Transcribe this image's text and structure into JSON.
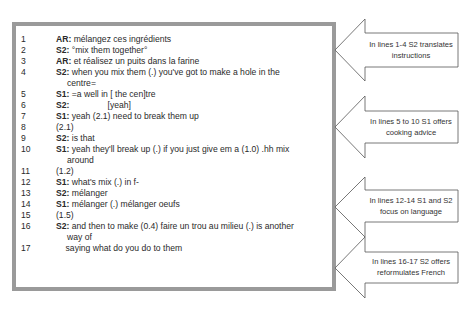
{
  "transcript": {
    "lines": [
      {
        "n": "1",
        "speaker": "AR:",
        "text": " mélangez ces ingrédients",
        "y": 8
      },
      {
        "n": "2",
        "speaker": "S2:",
        "text": " °mix them together°",
        "y": 19
      },
      {
        "n": "3",
        "speaker": "AR:",
        "text": " et réalisez un puits dans la farine",
        "y": 30
      },
      {
        "n": "4",
        "speaker": "S2:",
        "text": " when you mix them (.) you've got to make a hole in the",
        "y": 41,
        "cont": "centre="
      },
      {
        "n": "5",
        "speaker": "S1:",
        "text": " =a well in [ the cen]tre",
        "y": 63
      },
      {
        "n": "6",
        "speaker": "S2:",
        "text": "                [yeah]",
        "y": 74
      },
      {
        "n": "7",
        "speaker": "S1:",
        "text": " yeah (2.1) need to break them up",
        "y": 85
      },
      {
        "n": "8",
        "speaker": "",
        "text": "(2.1)",
        "y": 96
      },
      {
        "n": "9",
        "speaker": "S2:",
        "text": " is that",
        "y": 107
      },
      {
        "n": "10",
        "speaker": "S1:",
        "text": " yeah they'll break up (.) if you just give em a (1.0) .hh mix",
        "y": 118,
        "cont": "around"
      },
      {
        "n": "11",
        "speaker": "",
        "text": "(1.2)",
        "y": 140
      },
      {
        "n": "12",
        "speaker": "S1:",
        "text": " what's mix (.) in f-",
        "y": 151
      },
      {
        "n": "13",
        "speaker": "S2:",
        "text": " mélanger",
        "y": 162
      },
      {
        "n": "14",
        "speaker": "S1:",
        "text": " mélanger (.) mélanger oeufs",
        "y": 173
      },
      {
        "n": "15",
        "speaker": "",
        "text": "(1.5)",
        "y": 184
      },
      {
        "n": "16",
        "speaker": "S2:",
        "text": " and then to make (0.4) faire un trou au milieu (.) is another",
        "y": 195,
        "cont": "way of"
      },
      {
        "n": "17",
        "speaker": "",
        "text": "    saying what do you do to them",
        "y": 217
      }
    ]
  },
  "annotations": [
    {
      "label_line1": "In lines 1-4 S2 translates",
      "label_line2": "instructions",
      "tip_y": 50
    },
    {
      "label_line1": "In lines 5 to 10 S1 offers",
      "label_line2": "cooking advice",
      "tip_y": 127
    },
    {
      "label_line1": "In lines 12-14 S1 and S2",
      "label_line2": "focus on language",
      "tip_y": 207
    },
    {
      "label_line1": "In lines 16-17 S2 offers",
      "label_line2": "reformulates French",
      "tip_y": 267
    }
  ],
  "colors": {
    "border": "#9a9a9a",
    "arrow_stroke": "#555555"
  }
}
